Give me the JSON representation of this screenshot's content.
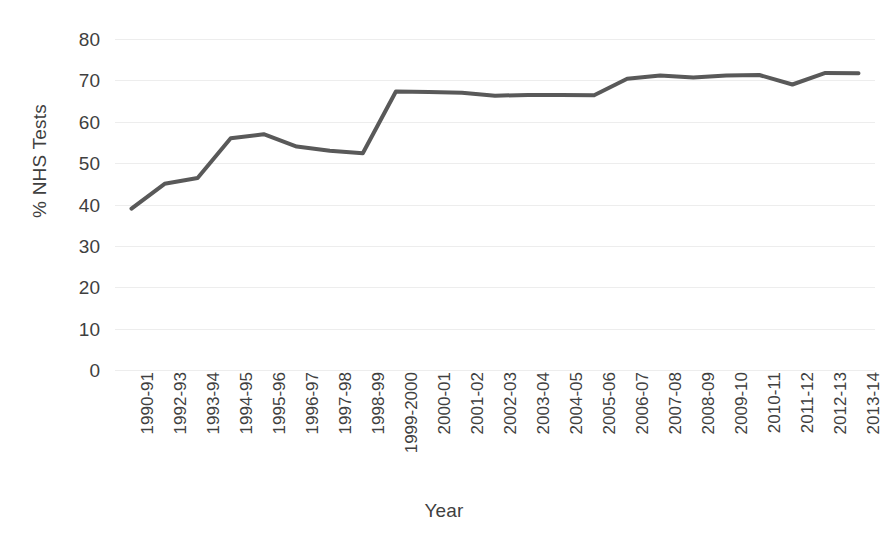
{
  "chart_data": {
    "type": "line",
    "title": "",
    "xlabel": "Year",
    "ylabel": "% NHS Tests",
    "ylim": [
      0,
      80
    ],
    "ytick_step": 10,
    "yticks": [
      80,
      70,
      60,
      50,
      40,
      30,
      20,
      10,
      0
    ],
    "grid": true,
    "legend": "none",
    "line_color": "#595959",
    "line_width": 4,
    "categories": [
      "1990-91",
      "1992-93",
      "1993-94",
      "1994-95",
      "1995-96",
      "1996-97",
      "1997-98",
      "1998-99",
      "1999-2000",
      "2000-01",
      "2001-02",
      "2002-03",
      "2003-04",
      "2004-05",
      "2005-06",
      "2006-07",
      "2007-08",
      "2008-09",
      "2009-10",
      "2010-11",
      "2011-12",
      "2012-13",
      "2013-14"
    ],
    "values": [
      39.0,
      45.0,
      46.4,
      56.0,
      57.0,
      54.0,
      53.0,
      52.4,
      67.3,
      67.2,
      67.0,
      66.3,
      66.5,
      66.5,
      66.4,
      70.4,
      71.2,
      70.7,
      71.2,
      71.3,
      69.0,
      71.8,
      71.7
    ]
  },
  "colors": {
    "line": "#595959",
    "gridline": "#ededed",
    "text": "#3f3f3f",
    "background": "#ffffff"
  }
}
